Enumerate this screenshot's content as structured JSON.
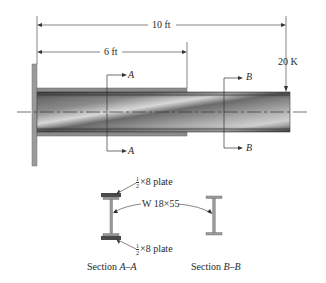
{
  "diagram": {
    "type": "cantilever-beam-with-cover-plates",
    "dimensions": {
      "overall": "10 ft",
      "plated_length": "6 ft"
    },
    "load": {
      "label": "20 K",
      "position": "free end"
    },
    "section_markers": {
      "a_top": "A",
      "a_bottom": "A",
      "b_top": "B",
      "b_bottom": "B"
    },
    "cross_sections": {
      "top_plate": {
        "frac_num": "1",
        "frac_den": "2",
        "suffix": "×8 plate"
      },
      "bottom_plate": {
        "frac_num": "1",
        "frac_den": "2",
        "suffix": "×8 plate"
      },
      "shape_label": "W 18×55",
      "section_aa": {
        "prefix": "Section ",
        "name": "A–A"
      },
      "section_bb": {
        "prefix": "Section ",
        "name": "B–B"
      }
    },
    "colors": {
      "steel_dark": "#4a4a4a",
      "steel_light": "#d8d8d8",
      "plate": "#555555",
      "line": "#333333"
    }
  }
}
